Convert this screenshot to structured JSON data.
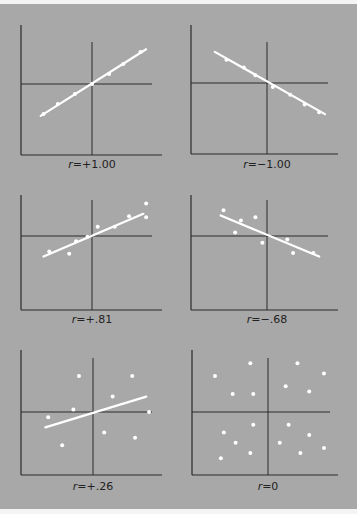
{
  "figure": {
    "background": "#a8a8a8",
    "axis_color": "#2a2a2a",
    "point_color": "#ffffff",
    "line_color": "#ffffff"
  },
  "chart_data": [
    {
      "type": "scatter",
      "title": "r=+1.00",
      "label_prefix": "r",
      "label_value": "=+1.00",
      "r": 1.0,
      "points": [
        [
          -0.85,
          -0.75
        ],
        [
          -0.6,
          -0.5
        ],
        [
          -0.3,
          -0.25
        ],
        [
          0,
          0
        ],
        [
          0.3,
          0.25
        ],
        [
          0.55,
          0.5
        ],
        [
          0.85,
          0.8
        ]
      ],
      "fit_line": [
        [
          -0.9,
          -0.8
        ],
        [
          0.95,
          0.87
        ]
      ],
      "grid": false
    },
    {
      "type": "scatter",
      "title": "r=-1.00",
      "label_prefix": "r",
      "label_value": "=−1.00",
      "r": -1.0,
      "points": [
        [
          -0.7,
          0.6
        ],
        [
          -0.4,
          0.4
        ],
        [
          -0.2,
          0.2
        ],
        [
          0.1,
          -0.1
        ],
        [
          0.4,
          -0.3
        ],
        [
          0.65,
          -0.55
        ],
        [
          0.9,
          -0.75
        ]
      ],
      "fit_line": [
        [
          -0.9,
          0.8
        ],
        [
          1.0,
          -0.8
        ]
      ],
      "grid": false
    },
    {
      "type": "scatter",
      "title": "r=+.81",
      "label_prefix": "r",
      "label_value": "=+.81",
      "r": 0.81,
      "points": [
        [
          -0.75,
          -0.45
        ],
        [
          -0.4,
          -0.52
        ],
        [
          -0.28,
          -0.15
        ],
        [
          0.1,
          0.27
        ],
        [
          0.4,
          0.27
        ],
        [
          0.65,
          0.58
        ],
        [
          0.95,
          0.55
        ],
        [
          0.95,
          0.95
        ],
        [
          -0.08,
          -0.02
        ]
      ],
      "fit_line": [
        [
          -0.85,
          -0.6
        ],
        [
          0.9,
          0.65
        ]
      ],
      "grid": false
    },
    {
      "type": "scatter",
      "title": "r=-.68",
      "label_prefix": "r",
      "label_value": "=−.68",
      "r": -0.68,
      "points": [
        [
          -0.75,
          0.75
        ],
        [
          -0.55,
          0.1
        ],
        [
          -0.45,
          0.45
        ],
        [
          -0.2,
          0.55
        ],
        [
          -0.08,
          -0.2
        ],
        [
          0.35,
          -0.1
        ],
        [
          0.45,
          -0.5
        ],
        [
          0.8,
          -0.5
        ]
      ],
      "fit_line": [
        [
          -0.8,
          0.6
        ],
        [
          0.9,
          -0.6
        ]
      ],
      "grid": false
    },
    {
      "type": "scatter",
      "title": "r=+.26",
      "label_prefix": "r",
      "label_value": "=+.26",
      "r": 0.26,
      "points": [
        [
          -0.8,
          -0.1
        ],
        [
          -0.55,
          -0.65
        ],
        [
          -0.35,
          0.05
        ],
        [
          -0.25,
          0.7
        ],
        [
          0.2,
          -0.4
        ],
        [
          0.35,
          0.3
        ],
        [
          0.7,
          0.7
        ],
        [
          0.75,
          -0.5
        ],
        [
          1.0,
          0.0
        ]
      ],
      "fit_line": [
        [
          -0.85,
          -0.3
        ],
        [
          0.95,
          0.3
        ]
      ],
      "grid": false
    },
    {
      "type": "scatter",
      "title": "r=0",
      "label_prefix": "r",
      "label_value": "=0",
      "r": 0,
      "points": [
        [
          -0.9,
          0.7
        ],
        [
          -0.75,
          -0.4
        ],
        [
          -0.8,
          -0.9
        ],
        [
          -0.6,
          0.35
        ],
        [
          -0.55,
          -0.6
        ],
        [
          -0.3,
          0.95
        ],
        [
          -0.3,
          -0.8
        ],
        [
          -0.25,
          0.35
        ],
        [
          -0.25,
          -0.25
        ],
        [
          0.2,
          -0.6
        ],
        [
          0.3,
          0.5
        ],
        [
          0.35,
          -0.25
        ],
        [
          0.5,
          0.95
        ],
        [
          0.55,
          -0.8
        ],
        [
          0.7,
          -0.45
        ],
        [
          0.7,
          0.4
        ],
        [
          0.95,
          0.75
        ],
        [
          0.95,
          -0.7
        ]
      ],
      "fit_line": null,
      "grid": false
    }
  ]
}
